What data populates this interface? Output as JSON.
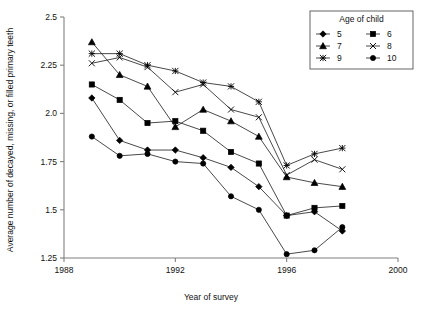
{
  "chart_data": {
    "type": "line",
    "title": "",
    "xlabel": "Year of survey",
    "ylabel": "Average number of decayed, missing, or filled primary teeth",
    "xlim": [
      1988,
      2000
    ],
    "ylim": [
      1.25,
      2.5
    ],
    "xticks": [
      1988,
      1992,
      1996,
      2000
    ],
    "xtick_labels": [
      "1988",
      "1992",
      "1996",
      "2000"
    ],
    "yticks": [
      1.25,
      1.5,
      1.75,
      2.0,
      2.25,
      2.5
    ],
    "ytick_labels": [
      "1.25",
      "1.5",
      "1.75",
      "2.0",
      "2.25",
      "2.5"
    ],
    "grid": false,
    "legend_position": "top-right",
    "legend_title": "Age of child",
    "x": [
      1989,
      1990,
      1991,
      1992,
      1993,
      1994,
      1995,
      1996,
      1997,
      1998
    ],
    "series": [
      {
        "name": "5",
        "marker": "diamond",
        "values": [
          2.08,
          1.86,
          1.81,
          1.81,
          1.77,
          1.72,
          1.62,
          1.47,
          1.49,
          1.39
        ]
      },
      {
        "name": "6",
        "marker": "square",
        "values": [
          2.15,
          2.07,
          1.95,
          1.96,
          1.91,
          1.8,
          1.74,
          1.47,
          1.51,
          1.52
        ]
      },
      {
        "name": "7",
        "marker": "triangle",
        "values": [
          2.37,
          2.2,
          2.14,
          1.93,
          2.02,
          1.96,
          1.88,
          1.67,
          1.64,
          1.62
        ]
      },
      {
        "name": "8",
        "marker": "cross",
        "values": [
          2.26,
          2.29,
          2.24,
          2.11,
          2.15,
          2.02,
          1.98,
          1.68,
          1.76,
          1.71
        ]
      },
      {
        "name": "9",
        "marker": "star",
        "values": [
          2.31,
          2.31,
          2.25,
          2.22,
          2.16,
          2.14,
          2.06,
          1.73,
          1.79,
          1.82
        ]
      },
      {
        "name": "10",
        "marker": "circle",
        "values": [
          1.88,
          1.78,
          1.79,
          1.75,
          1.74,
          1.57,
          1.5,
          1.27,
          1.29,
          1.41
        ]
      }
    ]
  },
  "legend": {
    "title": "Age of child",
    "entries": [
      {
        "label": "5",
        "marker": "diamond"
      },
      {
        "label": "6",
        "marker": "square"
      },
      {
        "label": "7",
        "marker": "triangle"
      },
      {
        "label": "8",
        "marker": "cross"
      },
      {
        "label": "9",
        "marker": "star"
      },
      {
        "label": "10",
        "marker": "circle"
      }
    ]
  },
  "colors": {
    "ink": "#000000",
    "axis": "#808080",
    "background": "#ffffff"
  }
}
